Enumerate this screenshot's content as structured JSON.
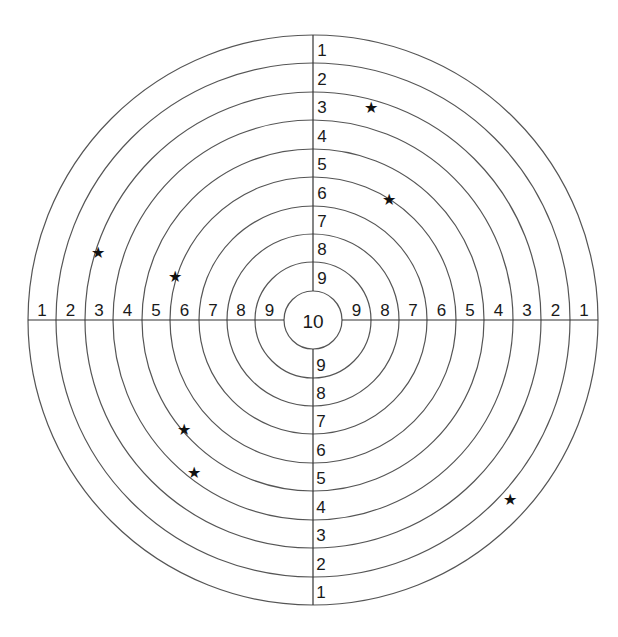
{
  "target": {
    "center": {
      "x": 313,
      "y": 320
    },
    "ring_radii": [
      285,
      257,
      228,
      200,
      171,
      143,
      114,
      86,
      58,
      29
    ],
    "stroke_color": "#555555",
    "center_label": "10",
    "top_labels": [
      "1",
      "2",
      "3",
      "4",
      "5",
      "6",
      "7",
      "8",
      "9"
    ],
    "bottom_labels": [
      "9",
      "8",
      "7",
      "6",
      "5",
      "4",
      "3",
      "2",
      "1"
    ],
    "left_labels": [
      "1",
      "2",
      "3",
      "4",
      "5",
      "6",
      "7",
      "8",
      "9"
    ],
    "right_labels": [
      "9",
      "8",
      "7",
      "6",
      "5",
      "4",
      "3",
      "2",
      "1"
    ]
  },
  "hits": [
    {
      "x": 371,
      "y": 108,
      "icon": "star-icon",
      "glyph": "★"
    },
    {
      "x": 389,
      "y": 200,
      "icon": "star-icon",
      "glyph": "★"
    },
    {
      "x": 98,
      "y": 253,
      "icon": "star-icon",
      "glyph": "★"
    },
    {
      "x": 175,
      "y": 277,
      "icon": "star-icon",
      "glyph": "★"
    },
    {
      "x": 184,
      "y": 430,
      "icon": "star-icon",
      "glyph": "★"
    },
    {
      "x": 194,
      "y": 473,
      "icon": "star-icon",
      "glyph": "★"
    },
    {
      "x": 510,
      "y": 500,
      "icon": "star-icon",
      "glyph": "★"
    }
  ]
}
